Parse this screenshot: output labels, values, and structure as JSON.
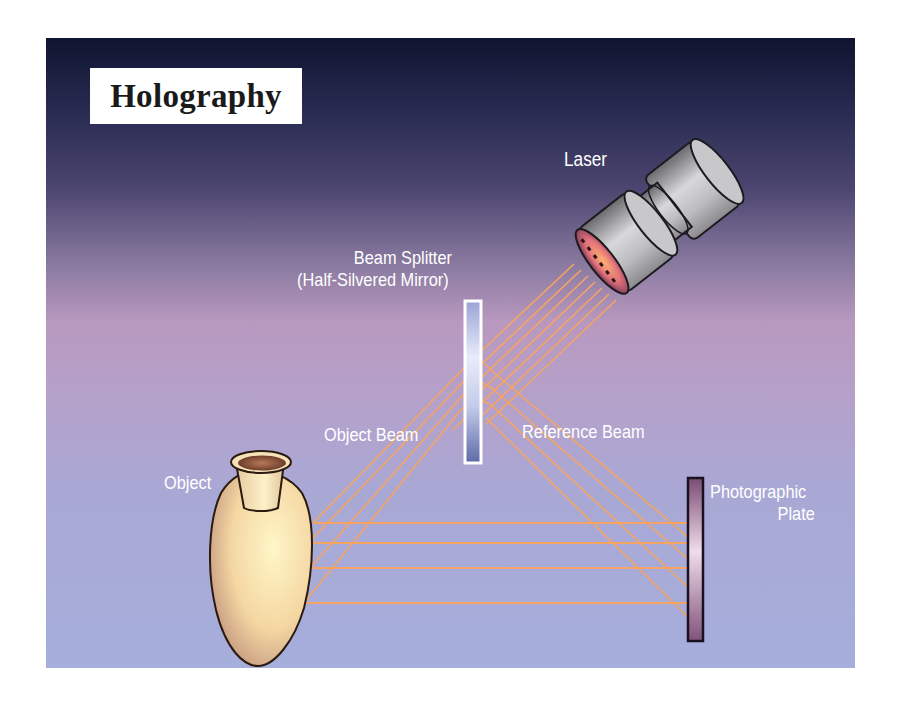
{
  "title": "Holography",
  "labels": {
    "laser": "Laser",
    "beam_splitter_line1": "Beam Splitter",
    "beam_splitter_line2": "(Half-Silvered Mirror)",
    "object_beam": "Object Beam",
    "reference_beam": "Reference Beam",
    "object": "Object",
    "photographic_plate_line1": "Photographic",
    "photographic_plate_line2": "Plate"
  },
  "components": [
    "Laser",
    "Beam Splitter (Half-Silvered Mirror)",
    "Object",
    "Photographic Plate"
  ],
  "beams": [
    "Object Beam",
    "Reference Beam"
  ],
  "colors": {
    "beam": "#f5a463",
    "background_top": "#0f1430",
    "background_mid": "#b898bf",
    "background_bottom": "#a6aedb",
    "vase": "#f2d9a8",
    "plate": "#8a5a80"
  }
}
